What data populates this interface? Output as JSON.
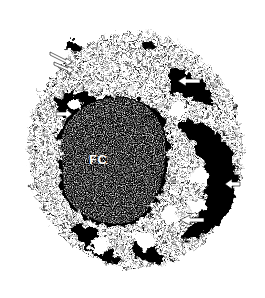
{
  "image": {
    "type": "electron-micrograph",
    "description": "Grayscale micrograph of a cell with a large dense dark mass and surrounding granular cytoplasm; white arrows mark peripheral structures",
    "colors": {
      "background": "#ffffff",
      "dense": "#000000",
      "label": "#ffffff"
    }
  },
  "labels": {
    "fc": "FC"
  },
  "arrows": [
    {
      "name": "arrow-top-left-1",
      "x": 52,
      "y": 56,
      "direction": "down-left"
    },
    {
      "name": "arrow-top-left-2",
      "x": 58,
      "y": 62,
      "direction": "down-left"
    },
    {
      "name": "arrow-left-fc",
      "x": 58,
      "y": 114,
      "direction": "right"
    },
    {
      "name": "arrow-top-right",
      "x": 180,
      "y": 80,
      "direction": "left"
    },
    {
      "name": "arrow-right",
      "x": 226,
      "y": 183,
      "direction": "left"
    },
    {
      "name": "arrow-lower-right",
      "x": 182,
      "y": 219,
      "direction": "left"
    }
  ]
}
